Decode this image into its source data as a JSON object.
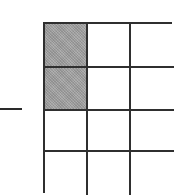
{
  "diagram": {
    "type": "fraction-area-model",
    "operator": {
      "symbol": "minus",
      "icon": "minus-icon"
    },
    "grid": {
      "rows": 4,
      "columns": 3,
      "total_cells": 12,
      "shaded_count": 2,
      "shaded_cells": [
        {
          "row": 0,
          "col": 0
        },
        {
          "row": 1,
          "col": 0
        }
      ],
      "colors": {
        "line": "#2f2f2f",
        "shaded_fill": "#a3a3a3",
        "empty_fill": "#ffffff"
      }
    }
  }
}
